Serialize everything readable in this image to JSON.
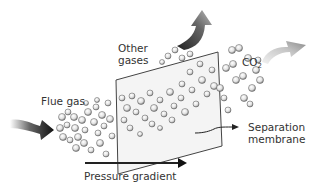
{
  "diagram": {
    "labels": {
      "flue_gas": "Flue gas",
      "other_gases_line1": "Other",
      "other_gases_line2": "gases",
      "co2_main": "CO",
      "co2_sub": "2",
      "separation_line1": "Separation",
      "separation_line2": "membrane",
      "pressure_gradient": "Pressure gradient"
    },
    "colors": {
      "text": "#333333",
      "membrane_edge": "#444444",
      "membrane_fill": "#f4f4f4",
      "arrow_dark": "#111111",
      "arrow_other_gases": "#3a3a3a",
      "arrow_co2": "#9a9a9a"
    }
  }
}
